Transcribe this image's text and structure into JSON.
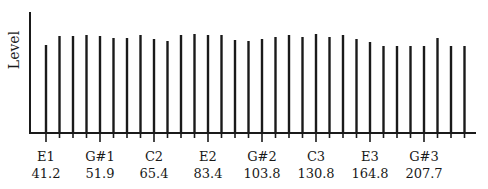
{
  "chart_data": {
    "type": "bar",
    "title": "",
    "xlabel": "",
    "ylabel": "Level",
    "grid": false,
    "legend": null,
    "note": "Stem (line) spectrum: one stem per semitone from E1 to B3; labels every 4 semitones",
    "categories": [
      "E1",
      "F1",
      "F#1",
      "G1",
      "G#1",
      "A1",
      "A#1",
      "B1",
      "C2",
      "C#2",
      "D2",
      "D#2",
      "E2",
      "F2",
      "F#2",
      "G2",
      "G#2",
      "A2",
      "A#2",
      "B2",
      "C3",
      "C#3",
      "D3",
      "D#3",
      "E3",
      "F3",
      "F#3",
      "G3",
      "G#3",
      "A3",
      "A#3",
      "B3"
    ],
    "values": [
      88,
      97,
      97,
      98,
      97,
      95,
      95,
      98,
      94,
      92,
      98,
      99,
      98,
      98,
      93,
      92,
      94,
      96,
      98,
      96,
      99,
      96,
      98,
      94,
      91,
      87,
      87,
      87,
      87,
      95,
      87,
      87
    ],
    "ylim": [
      0,
      121
    ],
    "tick_labels": [
      {
        "note": "E1",
        "freq": "41.2"
      },
      {
        "note": "G#1",
        "freq": "51.9"
      },
      {
        "note": "C2",
        "freq": "65.4"
      },
      {
        "note": "E2",
        "freq": "83.4"
      },
      {
        "note": "G#2",
        "freq": "103.8"
      },
      {
        "note": "C3",
        "freq": "130.8"
      },
      {
        "note": "E3",
        "freq": "164.8"
      },
      {
        "note": "G#3",
        "freq": "207.7"
      }
    ],
    "labeled_every": 4
  },
  "layout": {
    "axis_x": 30,
    "axis_top": 12,
    "baseline": 133,
    "axis_right": 476,
    "first_bar_x": 46,
    "bar_spacing": 13.5,
    "bar_width": 2.4,
    "color": "#1a1a1a"
  }
}
